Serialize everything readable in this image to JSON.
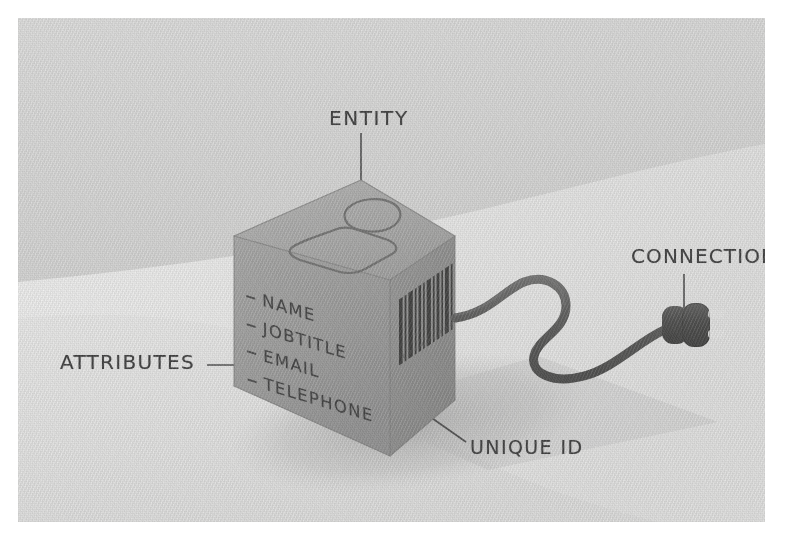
{
  "illustration": {
    "title": "Entity cube concept diagram",
    "style": "hand-drawn isometric sketch, grayscale, grainy paper texture"
  },
  "labels": {
    "entity": "ENTITY",
    "connection": "CONNECTION",
    "attributes": "ATTRIBUTES",
    "unique_id": "UNIQUE ID"
  },
  "cube": {
    "attributes": [
      {
        "label": "NAME"
      },
      {
        "label": "JOBTITLE"
      },
      {
        "label": "EMAIL"
      },
      {
        "label": "TELEPHONE"
      }
    ],
    "top_face_icon": "person-icon",
    "right_face_icon": "barcode-icon",
    "barcode_digits": "1 8 3 4 6 7 8 0 4 9"
  },
  "connector": {
    "icon": "power-plug-icon",
    "cable": "s-curved-cable"
  },
  "colors": {
    "background_light": "#e3e3e3",
    "background_dark": "#c9c9c9",
    "band_highlight": "#eeeeee",
    "cube_left_face": "#9c9c9c",
    "cube_right_face": "#8d8d8d",
    "cube_top_face": "#a9a9a9",
    "ink": "#3a3a3a",
    "plug_body": "#4a4a4a",
    "shadow": "#b4b4b4"
  }
}
